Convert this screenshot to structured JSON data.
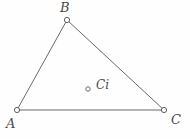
{
  "diagram": {
    "type": "geometry-figure",
    "background_color": "#fefefe",
    "line_color": "#6a6a6a",
    "label_color": "#4a4a4a",
    "canvas": {
      "width": 190,
      "height": 139
    },
    "vertices": [
      {
        "id": "A",
        "label": "A",
        "x": 17,
        "y": 110,
        "marker": "open-circle",
        "radius": 2.6
      },
      {
        "id": "B",
        "label": "B",
        "x": 67,
        "y": 20,
        "marker": "open-circle",
        "radius": 2.6
      },
      {
        "id": "C",
        "label": "C",
        "x": 164,
        "y": 110,
        "marker": "open-circle",
        "radius": 2.6
      }
    ],
    "interior_points": [
      {
        "id": "Ci",
        "label": "Ci",
        "x": 88,
        "y": 89,
        "marker": "open-circle",
        "radius": 2.2
      }
    ],
    "edges": [
      {
        "id": "AB",
        "from": "A",
        "to": "B"
      },
      {
        "id": "BC",
        "from": "B",
        "to": "C"
      },
      {
        "id": "AC",
        "from": "A",
        "to": "C"
      }
    ]
  }
}
